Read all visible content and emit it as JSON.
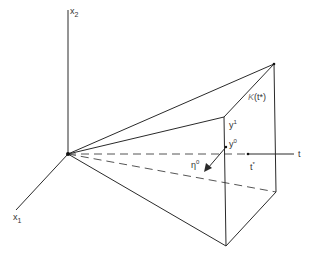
{
  "diagram": {
    "type": "3d-geometric-cone-diagram",
    "axes": {
      "vertical": {
        "label": "x",
        "subscript": "2"
      },
      "depth": {
        "label": "x",
        "subscript": "1"
      },
      "horizontal": {
        "label": "t"
      }
    },
    "labels": {
      "cone_face": {
        "text": "K(t*)",
        "main": "K",
        "arg": "(t*)"
      },
      "y1": {
        "main": "y",
        "sup": "1"
      },
      "y0": {
        "main": "y",
        "sup": "0"
      },
      "eta0": {
        "main": "η",
        "sup": "0"
      },
      "t_star": {
        "main": "t",
        "sup": "*"
      }
    },
    "colors": {
      "line": "#2a2a2a",
      "dashed": "#555555",
      "text": "#333333",
      "background": "#ffffff"
    }
  }
}
